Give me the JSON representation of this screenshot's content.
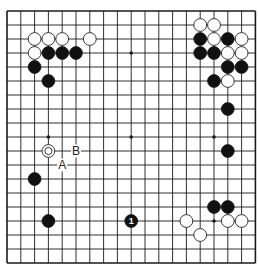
{
  "board": {
    "size": 19,
    "origin_x": 7,
    "origin_y": 11,
    "step_x": 13.8,
    "step_y": 14.0,
    "line_color": "#1a1a1a",
    "star_points": [
      [
        3,
        3
      ],
      [
        9,
        3
      ],
      [
        15,
        3
      ],
      [
        3,
        9
      ],
      [
        9,
        9
      ],
      [
        15,
        9
      ],
      [
        3,
        15
      ],
      [
        9,
        15
      ],
      [
        15,
        15
      ]
    ]
  },
  "stones": [
    {
      "color": "white",
      "col": 2,
      "row": 2
    },
    {
      "color": "white",
      "col": 3,
      "row": 2
    },
    {
      "color": "white",
      "col": 4,
      "row": 2
    },
    {
      "color": "white",
      "col": 6,
      "row": 2
    },
    {
      "color": "white",
      "col": 2,
      "row": 3
    },
    {
      "color": "black",
      "col": 3,
      "row": 3
    },
    {
      "color": "black",
      "col": 4,
      "row": 3
    },
    {
      "color": "black",
      "col": 5,
      "row": 3
    },
    {
      "color": "black",
      "col": 2,
      "row": 4
    },
    {
      "color": "black",
      "col": 3,
      "row": 5
    },
    {
      "color": "white",
      "col": 14,
      "row": 1
    },
    {
      "color": "white",
      "col": 15,
      "row": 1
    },
    {
      "color": "black",
      "col": 14,
      "row": 2
    },
    {
      "color": "white",
      "col": 15,
      "row": 2
    },
    {
      "color": "black",
      "col": 16,
      "row": 2
    },
    {
      "color": "white",
      "col": 17,
      "row": 2
    },
    {
      "color": "black",
      "col": 14,
      "row": 3
    },
    {
      "color": "black",
      "col": 15,
      "row": 3
    },
    {
      "color": "white",
      "col": 16,
      "row": 3
    },
    {
      "color": "white",
      "col": 17,
      "row": 3
    },
    {
      "color": "black",
      "col": 16,
      "row": 4
    },
    {
      "color": "black",
      "col": 17,
      "row": 4
    },
    {
      "color": "black",
      "col": 15,
      "row": 5
    },
    {
      "color": "white",
      "col": 16,
      "row": 5
    },
    {
      "color": "black",
      "col": 16,
      "row": 7
    },
    {
      "color": "black",
      "col": 16,
      "row": 10
    },
    {
      "color": "white",
      "col": 3,
      "row": 10,
      "marked": true
    },
    {
      "color": "black",
      "col": 2,
      "row": 12
    },
    {
      "color": "black",
      "col": 3,
      "row": 15
    },
    {
      "color": "black",
      "col": 9,
      "row": 15,
      "number": "1"
    },
    {
      "color": "black",
      "col": 15,
      "row": 14
    },
    {
      "color": "black",
      "col": 16,
      "row": 14
    },
    {
      "color": "white",
      "col": 13,
      "row": 15
    },
    {
      "color": "white",
      "col": 16,
      "row": 15
    },
    {
      "color": "white",
      "col": 17,
      "row": 15
    },
    {
      "color": "white",
      "col": 14,
      "row": 16
    }
  ],
  "labels": [
    {
      "text": "A",
      "col": 4,
      "row": 11
    },
    {
      "text": "B",
      "col": 5,
      "row": 10
    }
  ]
}
